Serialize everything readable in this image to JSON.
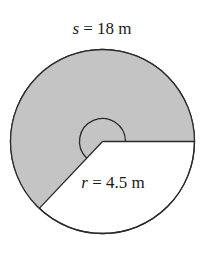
{
  "diagram": {
    "type": "circular-sector",
    "labels": {
      "arc_length": {
        "variable": "s",
        "equals": " = ",
        "value": "18 m"
      },
      "radius": {
        "variable": "r",
        "equals": " = ",
        "value": "4.5 m"
      }
    },
    "colors": {
      "shaded_sector": "#c4c4c4",
      "unshaded": "#ffffff",
      "stroke": "#2a2a2a"
    },
    "geometry": {
      "center": [
        102.5,
        141.5
      ],
      "radius_px": 92,
      "angle_marker_radius_px": 23
    }
  }
}
